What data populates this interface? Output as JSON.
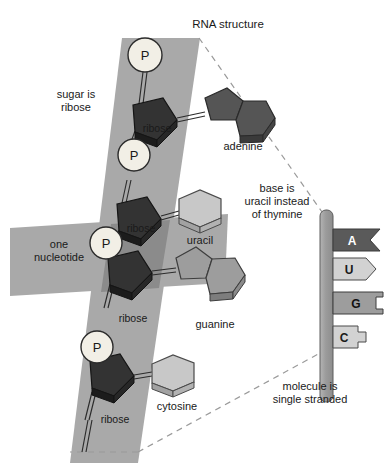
{
  "figure": {
    "title": "RNA structure",
    "width": 388,
    "height": 463
  },
  "annotations": {
    "sugar": "sugar is\nribose",
    "base_note": "base is\nuracil instead\nof thymine",
    "nucleotide": "one\nnucleotide",
    "single_stranded": "molecule is\nsingle stranded"
  },
  "backbone": {
    "phosphate_label": "P",
    "phosphates": [
      "P",
      "P",
      "P",
      "P"
    ],
    "sugar_label": "ribose",
    "sugars": [
      "ribose",
      "ribose",
      "ribose",
      "ribose"
    ]
  },
  "bases": [
    {
      "name": "adenine",
      "type": "purine",
      "color": "#555555"
    },
    {
      "name": "uracil",
      "type": "pyrimidine",
      "color": "#c8c8c8"
    },
    {
      "name": "guanine",
      "type": "purine",
      "color": "#9a9a9a"
    },
    {
      "name": "cytosine",
      "type": "pyrimidine",
      "color": "#c8c8c8"
    }
  ],
  "strand_schematic": {
    "tabs": [
      {
        "letter": "A",
        "shape": "notched",
        "color": "#5a5a5a",
        "text_color": "#ffffff"
      },
      {
        "letter": "U",
        "shape": "pointed",
        "color": "#d2d2d2",
        "text_color": "#1a1a1a"
      },
      {
        "letter": "G",
        "shape": "bracket",
        "color": "#9d9d9d",
        "text_color": "#111111"
      },
      {
        "letter": "C",
        "shape": "tab",
        "color": "#d2d2d2",
        "text_color": "#1a1a1a"
      }
    ]
  },
  "colors": {
    "band": "#a9a9a9",
    "band_overlap": "#8b8b8b",
    "ribose_face": "#333333",
    "ribose_side": "#1f1f1f",
    "phosphate_fill": "#f2efe6",
    "outline": "#2b2b2b",
    "dashed": "#999999",
    "strand_bar": "#9b9b9b",
    "background": "#ffffff"
  }
}
